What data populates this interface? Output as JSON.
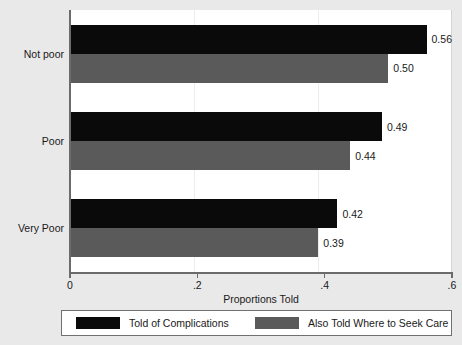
{
  "chart_data": {
    "type": "bar",
    "orientation": "horizontal",
    "title": "",
    "xlabel": "Proportions Told",
    "ylabel": "",
    "xlim": [
      0,
      0.6
    ],
    "xticks": [
      "0",
      ".2",
      ".4",
      ".6"
    ],
    "xtick_values": [
      0,
      0.2,
      0.4,
      0.6
    ],
    "grid": false,
    "categories": [
      "Not poor",
      "Poor",
      "Very Poor"
    ],
    "series": [
      {
        "name": "Told of Complications",
        "color": "#0a0a0a",
        "values": [
          0.56,
          0.49,
          0.42
        ],
        "labels": [
          "0.56",
          "0.49",
          "0.42"
        ]
      },
      {
        "name": "Also Told Where to Seek Care",
        "color": "#5a5a5a",
        "values": [
          0.5,
          0.44,
          0.39
        ],
        "labels": [
          "0.50",
          "0.44",
          "0.39"
        ]
      }
    ],
    "legend_position": "bottom"
  },
  "axis": {
    "x_title": "Proportions Told",
    "ticks": [
      {
        "label": "0",
        "value": 0
      },
      {
        "label": ".2",
        "value": 0.2
      },
      {
        "label": ".4",
        "value": 0.4
      },
      {
        "label": ".6",
        "value": 0.6
      }
    ],
    "categories": [
      {
        "label": "Not poor"
      },
      {
        "label": "Poor"
      },
      {
        "label": "Very Poor"
      }
    ]
  },
  "legend": {
    "entries": [
      {
        "label": "Told of Complications",
        "color": "#0a0a0a"
      },
      {
        "label": "Also Told Where to Seek Care",
        "color": "#5a5a5a"
      }
    ]
  },
  "colors": {
    "series_black": "#0a0a0a",
    "series_gray": "#5a5a5a",
    "figure_background": "#e9e9e9",
    "plot_background": "#ffffff",
    "axis_line": "#6b6b6b"
  }
}
